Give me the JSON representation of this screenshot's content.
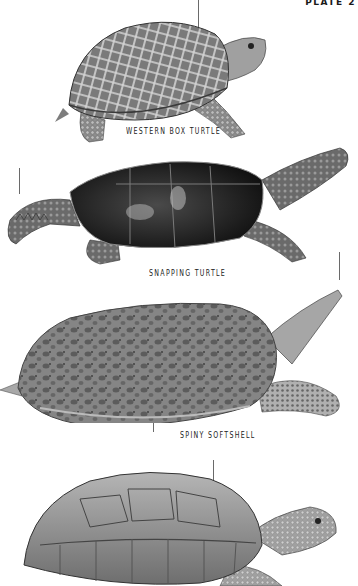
{
  "plate": {
    "label": "PLATE 2"
  },
  "specimens": [
    {
      "name": "WESTERN BOX TURTLE",
      "shell_color": "#8a8a8a",
      "pattern_color": "#d8d8d8"
    },
    {
      "name": "SNAPPING TURTLE",
      "shell_color": "#1e1e1e",
      "skin_color": "#6e6e6e"
    },
    {
      "name": "SPINY SOFTSHELL",
      "shell_color": "#7c7c7c",
      "spot_color": "#4a4a4a"
    },
    {
      "name": "",
      "shell_color": "#9a9a9a",
      "note": "label cut off below frame"
    }
  ],
  "colors": {
    "background": "#ffffff",
    "text": "#222222",
    "pointer_line": "#6a6a6a"
  }
}
